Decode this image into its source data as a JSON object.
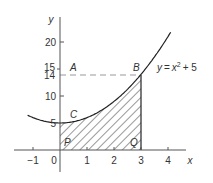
{
  "diagram": {
    "type": "area-under-curve",
    "equation_label": "y = x² + 5",
    "equation": {
      "y": "y",
      "eq": "=",
      "x": "x",
      "exp": "2",
      "rest": "+ 5"
    },
    "axes": {
      "x_label": "x",
      "y_label": "y",
      "x_ticks": [
        "−1",
        "0",
        "1",
        "2",
        "3",
        "4"
      ],
      "y_ticks": [
        "5",
        "10",
        "14",
        "15",
        "20"
      ]
    },
    "points": {
      "A": "A",
      "B": "B",
      "C": "C",
      "P": "P",
      "Q": "Q"
    },
    "shaded_region": {
      "from_x": 0,
      "to_x": 3,
      "description": "area under y = x² + 5 between x = 0 and x = 3"
    },
    "dashed_line": {
      "y": 14,
      "from_x": 0,
      "to_x": 3
    },
    "colors": {
      "curve": "#222222",
      "axes": "#555555",
      "dashed": "#999999",
      "hatch": "#333333"
    }
  },
  "chart_data": {
    "type": "line",
    "title": "",
    "xlabel": "x",
    "ylabel": "y",
    "xlim": [
      -1.5,
      4.8
    ],
    "ylim": [
      0,
      24
    ],
    "series": [
      {
        "name": "y = x^2 + 5",
        "x": [
          -1.2,
          -1,
          -0.5,
          0,
          0.5,
          1,
          1.5,
          2,
          2.5,
          3,
          3.5,
          4,
          4.1
        ],
        "y": [
          6.44,
          6,
          5.25,
          5,
          5.25,
          6,
          7.25,
          9,
          11.25,
          14,
          17.25,
          21,
          21.81
        ]
      }
    ],
    "annotations": [
      {
        "label": "A",
        "x": 0,
        "y": 14
      },
      {
        "label": "B",
        "x": 3,
        "y": 14
      },
      {
        "label": "C",
        "x": 0.5,
        "y": 5.25
      },
      {
        "label": "P",
        "x": 0,
        "y": 0
      },
      {
        "label": "Q",
        "x": 3,
        "y": 0
      }
    ],
    "shaded": {
      "x_from": 0,
      "x_to": 3,
      "under": "y = x^2 + 5"
    },
    "grid": false
  }
}
